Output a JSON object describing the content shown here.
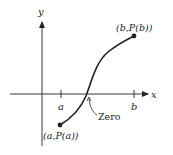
{
  "diagram": {
    "axes": {
      "x_label": "x",
      "y_label": "y"
    },
    "ticks": {
      "a_label": "a",
      "b_label": "b"
    },
    "points": {
      "start_label": "(a,P(a))",
      "end_label": "(b,P(b))"
    },
    "annotation": {
      "zero_label": "Zero"
    },
    "colors": {
      "ink": "#222222",
      "background": "#ffffff"
    }
  }
}
